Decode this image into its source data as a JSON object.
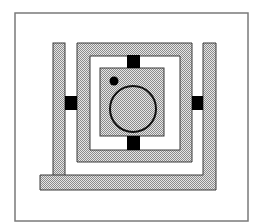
{
  "figure": {
    "colors": {
      "background": "#ffffff",
      "frame": "#7a7a7a",
      "stipple_light": "#e6e6e6",
      "stipple_dark": "#8c8c8c",
      "outline": "#3a3a3a",
      "bridge": "#000000"
    },
    "elements": {
      "frame": {
        "x": 15,
        "y": 13,
        "w": 233,
        "h": 208
      },
      "outer_left_bar": {
        "x": 53,
        "y": 43,
        "w": 12,
        "h": 133
      },
      "outer_bottom_right_L": {
        "bottom": {
          "x": 40,
          "y": 175,
          "w": 176,
          "h": 15
        },
        "right": {
          "x": 203,
          "y": 43,
          "w": 13,
          "h": 147
        }
      },
      "middle_ring": {
        "x": 77,
        "y": 43,
        "w": 115,
        "h": 119,
        "thickness": 12
      },
      "inner_square": {
        "x": 100,
        "y": 68,
        "w": 64,
        "h": 68
      },
      "circle": {
        "cx": 133,
        "cy": 109,
        "r": 23
      },
      "dot": {
        "cx": 114,
        "cy": 81,
        "r": 4.5
      },
      "bridges": [
        {
          "name": "left",
          "x": 65,
          "y": 96,
          "w": 12,
          "h": 14
        },
        {
          "name": "right",
          "x": 192,
          "y": 96,
          "w": 11,
          "h": 14
        },
        {
          "name": "top",
          "x": 127,
          "y": 55,
          "w": 13,
          "h": 13
        },
        {
          "name": "bottom",
          "x": 127,
          "y": 136,
          "w": 13,
          "h": 14
        }
      ]
    }
  }
}
